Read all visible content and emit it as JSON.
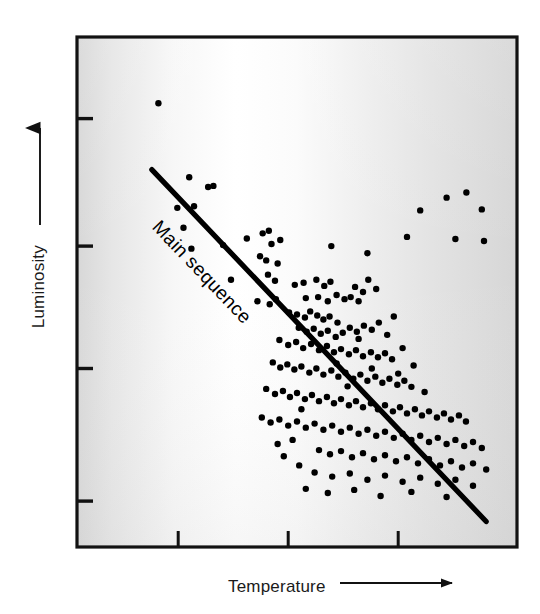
{
  "figure": {
    "kind": "scatter-plot"
  },
  "axes": {
    "y_label": "Luminosity",
    "x_label": "Temperature",
    "y_arrow_direction": "up",
    "x_arrow_direction": "right"
  },
  "annotations": {
    "main_sequence_label": "Main sequence"
  },
  "colors": {
    "ink": "#000000",
    "frame": "#111111",
    "plot_background_edge": "#d9d9d9",
    "plot_background_center": "#ffffff",
    "point_fill": "#000000",
    "trendline": "#000000"
  },
  "chart_data": {
    "type": "scatter",
    "title": "",
    "xlabel": "Temperature",
    "ylabel": "Luminosity",
    "xlim": [
      0,
      100
    ],
    "ylim": [
      0,
      100
    ],
    "grid": false,
    "legend": "none",
    "axis_note": "Axes are unlabeled/qualitative: arrows indicate increasing Temperature (right) and increasing Luminosity (up). Tick marks are unlabeled.",
    "x_ticks": [
      23,
      48,
      73
    ],
    "y_ticks": [
      9,
      35,
      59,
      84
    ],
    "trendline": {
      "name": "Main sequence",
      "x": [
        17,
        93
      ],
      "y": [
        74,
        5
      ],
      "label": "Main sequence",
      "label_rotation_deg": 37
    },
    "series": [
      {
        "name": "stars",
        "marker": "filled-circle",
        "points": [
          [
            18.5,
            87.0
          ],
          [
            25.5,
            72.5
          ],
          [
            29.8,
            70.6
          ],
          [
            31.0,
            70.8
          ],
          [
            22.8,
            66.5
          ],
          [
            26.6,
            66.8
          ],
          [
            24.2,
            62.6
          ],
          [
            26.0,
            58.5
          ],
          [
            33.2,
            59.2
          ],
          [
            38.6,
            60.5
          ],
          [
            42.2,
            61.5
          ],
          [
            43.6,
            62.0
          ],
          [
            44.2,
            59.4
          ],
          [
            46.2,
            60.2
          ],
          [
            41.6,
            57.0
          ],
          [
            43.0,
            56.2
          ],
          [
            45.6,
            55.6
          ],
          [
            43.4,
            53.4
          ],
          [
            45.0,
            52.2
          ],
          [
            35.0,
            52.4
          ],
          [
            78.0,
            66.0
          ],
          [
            84.0,
            68.5
          ],
          [
            88.5,
            69.5
          ],
          [
            92.0,
            66.2
          ],
          [
            75.0,
            60.8
          ],
          [
            86.0,
            60.4
          ],
          [
            92.5,
            60.0
          ],
          [
            57.8,
            59.0
          ],
          [
            66.0,
            57.6
          ],
          [
            41.0,
            48.2
          ],
          [
            43.8,
            47.6
          ],
          [
            45.2,
            48.6
          ],
          [
            49.5,
            51.4
          ],
          [
            51.5,
            51.8
          ],
          [
            54.4,
            52.4
          ],
          [
            56.2,
            51.2
          ],
          [
            57.6,
            52.0
          ],
          [
            52.0,
            48.8
          ],
          [
            54.8,
            49.0
          ],
          [
            57.0,
            48.2
          ],
          [
            59.0,
            49.4
          ],
          [
            60.8,
            48.6
          ],
          [
            62.2,
            49.0
          ],
          [
            64.0,
            48.2
          ],
          [
            65.0,
            50.0
          ],
          [
            63.2,
            51.0
          ],
          [
            66.2,
            52.4
          ],
          [
            68.0,
            50.6
          ],
          [
            48.2,
            46.0
          ],
          [
            50.0,
            45.6
          ],
          [
            51.8,
            45.0
          ],
          [
            53.0,
            46.2
          ],
          [
            54.6,
            45.4
          ],
          [
            56.0,
            44.6
          ],
          [
            57.4,
            45.2
          ],
          [
            59.2,
            44.0
          ],
          [
            50.4,
            43.0
          ],
          [
            52.2,
            42.2
          ],
          [
            53.8,
            42.8
          ],
          [
            55.4,
            41.8
          ],
          [
            57.0,
            42.4
          ],
          [
            58.8,
            41.2
          ],
          [
            60.4,
            42.0
          ],
          [
            62.0,
            43.0
          ],
          [
            63.6,
            42.2
          ],
          [
            65.2,
            43.4
          ],
          [
            67.0,
            42.6
          ],
          [
            68.6,
            44.0
          ],
          [
            46.0,
            40.6
          ],
          [
            48.0,
            39.6
          ],
          [
            49.8,
            40.2
          ],
          [
            51.4,
            39.0
          ],
          [
            53.2,
            39.8
          ],
          [
            55.0,
            38.6
          ],
          [
            56.8,
            39.4
          ],
          [
            58.4,
            38.2
          ],
          [
            60.0,
            38.8
          ],
          [
            61.8,
            37.8
          ],
          [
            63.4,
            38.6
          ],
          [
            65.0,
            37.4
          ],
          [
            66.8,
            38.2
          ],
          [
            68.4,
            37.2
          ],
          [
            70.0,
            38.0
          ],
          [
            71.6,
            36.8
          ],
          [
            44.5,
            36.2
          ],
          [
            46.2,
            35.2
          ],
          [
            47.8,
            35.8
          ],
          [
            49.4,
            34.8
          ],
          [
            51.0,
            35.4
          ],
          [
            52.8,
            34.2
          ],
          [
            54.4,
            35.0
          ],
          [
            56.0,
            33.8
          ],
          [
            57.8,
            34.6
          ],
          [
            59.4,
            33.4
          ],
          [
            61.0,
            34.2
          ],
          [
            62.8,
            33.0
          ],
          [
            64.4,
            33.8
          ],
          [
            66.0,
            32.6
          ],
          [
            67.8,
            33.4
          ],
          [
            69.4,
            32.2
          ],
          [
            71.0,
            33.0
          ],
          [
            72.8,
            31.8
          ],
          [
            74.4,
            32.6
          ],
          [
            76.0,
            31.4
          ],
          [
            43.0,
            31.0
          ],
          [
            45.0,
            30.0
          ],
          [
            46.8,
            30.6
          ],
          [
            48.4,
            29.4
          ],
          [
            50.0,
            30.2
          ],
          [
            51.8,
            29.0
          ],
          [
            53.4,
            29.8
          ],
          [
            55.0,
            28.6
          ],
          [
            56.8,
            29.4
          ],
          [
            58.4,
            28.2
          ],
          [
            60.0,
            29.0
          ],
          [
            61.8,
            27.8
          ],
          [
            63.4,
            28.6
          ],
          [
            65.0,
            27.4
          ],
          [
            66.8,
            28.2
          ],
          [
            68.4,
            27.0
          ],
          [
            70.0,
            27.8
          ],
          [
            71.8,
            26.6
          ],
          [
            73.4,
            27.4
          ],
          [
            75.0,
            26.2
          ],
          [
            76.8,
            27.0
          ],
          [
            78.4,
            25.8
          ],
          [
            80.0,
            26.6
          ],
          [
            81.8,
            25.4
          ],
          [
            83.4,
            26.2
          ],
          [
            85.0,
            25.0
          ],
          [
            86.8,
            25.8
          ],
          [
            88.4,
            24.6
          ],
          [
            42.0,
            25.4
          ],
          [
            44.0,
            24.4
          ],
          [
            46.0,
            25.0
          ],
          [
            48.0,
            23.8
          ],
          [
            50.0,
            24.6
          ],
          [
            52.0,
            23.4
          ],
          [
            54.0,
            24.2
          ],
          [
            56.0,
            23.0
          ],
          [
            58.0,
            23.8
          ],
          [
            60.0,
            22.6
          ],
          [
            62.0,
            23.4
          ],
          [
            64.0,
            22.2
          ],
          [
            66.0,
            23.0
          ],
          [
            68.0,
            21.8
          ],
          [
            70.0,
            22.6
          ],
          [
            72.0,
            21.4
          ],
          [
            74.0,
            22.2
          ],
          [
            76.0,
            21.0
          ],
          [
            78.0,
            21.8
          ],
          [
            80.0,
            20.6
          ],
          [
            82.0,
            21.4
          ],
          [
            84.0,
            20.2
          ],
          [
            86.0,
            21.0
          ],
          [
            88.0,
            19.8
          ],
          [
            90.0,
            20.6
          ],
          [
            92.0,
            19.4
          ],
          [
            55.0,
            19.0
          ],
          [
            57.5,
            18.2
          ],
          [
            60.0,
            18.8
          ],
          [
            62.5,
            17.6
          ],
          [
            65.0,
            18.4
          ],
          [
            67.5,
            17.2
          ],
          [
            70.0,
            18.0
          ],
          [
            72.5,
            16.8
          ],
          [
            75.0,
            17.6
          ],
          [
            77.5,
            16.4
          ],
          [
            80.0,
            17.2
          ],
          [
            82.5,
            16.0
          ],
          [
            85.0,
            16.8
          ],
          [
            87.5,
            15.6
          ],
          [
            90.0,
            16.4
          ],
          [
            93.0,
            15.2
          ],
          [
            54.0,
            14.6
          ],
          [
            58.0,
            13.8
          ],
          [
            62.0,
            14.4
          ],
          [
            66.0,
            13.2
          ],
          [
            70.0,
            14.0
          ],
          [
            74.0,
            12.8
          ],
          [
            78.0,
            13.6
          ],
          [
            82.0,
            12.4
          ],
          [
            86.0,
            13.2
          ],
          [
            90.0,
            12.0
          ],
          [
            52.0,
            11.4
          ],
          [
            57.0,
            10.6
          ],
          [
            63.0,
            11.2
          ],
          [
            69.0,
            10.0
          ],
          [
            76.0,
            10.8
          ],
          [
            84.0,
            9.8
          ],
          [
            64.0,
            40.8
          ],
          [
            70.5,
            41.6
          ],
          [
            72.0,
            45.2
          ],
          [
            74.0,
            39.0
          ],
          [
            76.5,
            35.6
          ],
          [
            79.0,
            30.4
          ],
          [
            47.0,
            17.8
          ],
          [
            49.0,
            21.0
          ],
          [
            51.0,
            27.0
          ],
          [
            45.6,
            20.2
          ],
          [
            50.5,
            16.0
          ],
          [
            59.0,
            36.0
          ],
          [
            61.5,
            31.5
          ],
          [
            67.0,
            35.0
          ],
          [
            73.0,
            34.0
          ]
        ]
      }
    ]
  }
}
